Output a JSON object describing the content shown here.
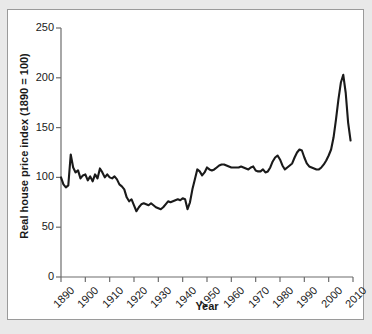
{
  "figure": {
    "background_color": "#e9e9e9",
    "panel_color": "#ffffff",
    "line_color": "#1a1a1a"
  },
  "chart_data": {
    "type": "line",
    "title": "",
    "xlabel": "Year",
    "ylabel": "Real house price index (1890 = 100)",
    "xlim": [
      1890,
      2010
    ],
    "ylim": [
      0,
      250
    ],
    "xticks": [
      1890,
      1900,
      1910,
      1920,
      1930,
      1940,
      1950,
      1960,
      1970,
      1980,
      1990,
      2000,
      2010
    ],
    "yticks": [
      0,
      50,
      100,
      150,
      200,
      250
    ],
    "xtick_labels": [
      "1890",
      "1900",
      "1910",
      "1920",
      "1930",
      "1940",
      "1950",
      "1960",
      "1970",
      "1980",
      "1990",
      "2000",
      "2010"
    ],
    "ytick_labels": [
      "0",
      "50",
      "100",
      "150",
      "200",
      "250"
    ],
    "grid": false,
    "legend": false,
    "series": [
      {
        "name": "Real house price index",
        "x": [
          1890,
          1891,
          1892,
          1893,
          1894,
          1895,
          1896,
          1897,
          1898,
          1899,
          1900,
          1901,
          1902,
          1903,
          1904,
          1905,
          1906,
          1907,
          1908,
          1909,
          1910,
          1911,
          1912,
          1913,
          1914,
          1915,
          1916,
          1917,
          1918,
          1919,
          1920,
          1921,
          1922,
          1923,
          1924,
          1925,
          1926,
          1927,
          1928,
          1929,
          1930,
          1931,
          1932,
          1933,
          1934,
          1935,
          1936,
          1937,
          1938,
          1939,
          1940,
          1941,
          1942,
          1943,
          1944,
          1945,
          1946,
          1947,
          1948,
          1949,
          1950,
          1951,
          1952,
          1953,
          1954,
          1955,
          1956,
          1957,
          1958,
          1959,
          1960,
          1961,
          1962,
          1963,
          1964,
          1965,
          1966,
          1967,
          1968,
          1969,
          1970,
          1971,
          1972,
          1973,
          1974,
          1975,
          1976,
          1977,
          1978,
          1979,
          1980,
          1981,
          1982,
          1983,
          1984,
          1985,
          1986,
          1987,
          1988,
          1989,
          1990,
          1991,
          1992,
          1993,
          1994,
          1995,
          1996,
          1997,
          1998,
          1999,
          2000,
          2001,
          2002,
          2003,
          2004,
          2005,
          2006,
          2007,
          2008,
          2009
        ],
        "values": [
          100,
          93,
          90,
          92,
          123,
          110,
          105,
          107,
          99,
          102,
          103,
          97,
          101,
          96,
          103,
          99,
          109,
          105,
          100,
          103,
          100,
          99,
          101,
          98,
          93,
          91,
          88,
          80,
          76,
          78,
          72,
          66,
          70,
          73,
          74,
          73,
          72,
          74,
          72,
          70,
          69,
          68,
          70,
          73,
          76,
          75,
          76,
          77,
          78,
          77,
          79,
          78,
          68,
          75,
          88,
          98,
          108,
          106,
          102,
          105,
          110,
          108,
          107,
          108,
          110,
          112,
          113,
          113,
          112,
          111,
          110,
          110,
          110,
          110,
          111,
          110,
          109,
          108,
          110,
          111,
          107,
          106,
          106,
          108,
          105,
          106,
          110,
          116,
          120,
          122,
          118,
          112,
          108,
          110,
          112,
          114,
          120,
          125,
          128,
          127,
          120,
          114,
          111,
          110,
          109,
          108,
          108,
          110,
          113,
          117,
          122,
          128,
          140,
          158,
          178,
          195,
          203,
          185,
          155,
          137
        ]
      }
    ]
  },
  "axis": {
    "y_title": "Real house price index (1890 = 100)",
    "x_title": "Year"
  }
}
